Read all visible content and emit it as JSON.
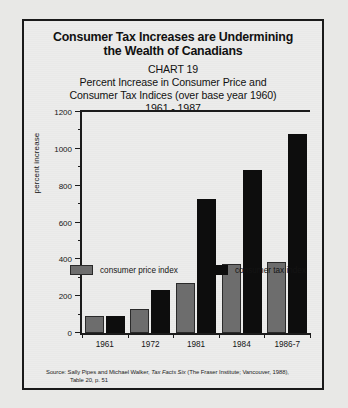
{
  "scan_header": "",
  "title": {
    "line1": "Consumer Tax Increases are Undermining",
    "line2": "the Wealth of Canadians"
  },
  "subtitle": {
    "line1": "CHART 19",
    "line2": "Percent Increase in Consumer Price and",
    "line3": "Consumer Tax Indices (over base year 1960)",
    "line4": "1961 - 1987"
  },
  "source": {
    "line1_pre": "Source: Sally Pipes and Michael Walker, ",
    "line1_italic": "Tax Facts Six",
    "line1_post": "  (The Fraser Institute; Vancouver, 1988),",
    "line2": "Table 20, p. 51"
  },
  "colors": {
    "consumer_price_index": "#6d6d6d",
    "consumer_tax_index": "#0d0d0d",
    "axis": "#1b1b1b",
    "paper": "#ececeb"
  },
  "chart_data": {
    "type": "bar",
    "title": "Consumer Tax Increases are Undermining the Wealth of Canadians",
    "subtitle": "CHART 19 — Percent Increase in Consumer Price and Consumer Tax Indices (over base year 1960), 1961 - 1987",
    "xlabel": "",
    "ylabel": "percent increase",
    "ylim": [
      0,
      1200
    ],
    "yticks": [
      0,
      200,
      400,
      600,
      800,
      1000,
      1200
    ],
    "ytick_labels": [
      "0",
      "200",
      "400",
      "600",
      "800",
      "1000",
      "1200"
    ],
    "yminor_step": 100,
    "grid": false,
    "legend_position": "bottom",
    "categories": [
      "1961",
      "1972",
      "1981",
      "1984",
      "1986-7"
    ],
    "series": [
      {
        "name": "consumer price index",
        "color": "#6d6d6d",
        "values": [
          95,
          130,
          270,
          375,
          385
        ]
      },
      {
        "name": "consumer tax index",
        "color": "#0d0d0d",
        "values": [
          95,
          235,
          730,
          885,
          1080
        ]
      }
    ]
  }
}
